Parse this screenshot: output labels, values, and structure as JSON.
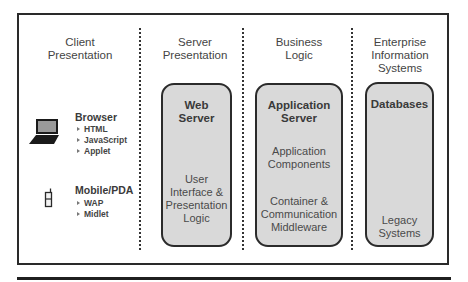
{
  "diagram": {
    "type": "multi-tier architecture",
    "columns": [
      {
        "id": "client",
        "title_line1": "Client",
        "title_line2": "Presentation"
      },
      {
        "id": "server",
        "title_line1": "Server",
        "title_line2": "Presentation"
      },
      {
        "id": "business",
        "title_line1": "Business",
        "title_line2": "Logic"
      },
      {
        "id": "eis",
        "title_line1": "Enterprise",
        "title_line2": "Information",
        "title_line3": "Systems"
      }
    ],
    "clients": [
      {
        "name": "Browser",
        "icon": "laptop-icon",
        "items": [
          "HTML",
          "JavaScript",
          "Applet"
        ]
      },
      {
        "name": "Mobile/PDA",
        "icon": "mobile-phone-icon",
        "items": [
          "WAP",
          "Midlet"
        ]
      }
    ],
    "tiers": {
      "web_server": {
        "title_line1": "Web",
        "title_line2": "Server",
        "text_lines": [
          "User",
          "Interface &",
          "Presentation",
          "Logic"
        ]
      },
      "app_server": {
        "title_line1": "Application",
        "title_line2": "Server",
        "group1_lines": [
          "Application",
          "Components"
        ],
        "group2_lines": [
          "Container &",
          "Communication",
          "Middleware"
        ]
      },
      "databases": {
        "title": "Databases",
        "text_lines": [
          "Legacy",
          "Systems"
        ]
      }
    },
    "colors": {
      "box_fill": "#d9d9d9",
      "box_border": "#2b2b2b",
      "frame": "#2a2a2a",
      "text": "#444444"
    }
  }
}
